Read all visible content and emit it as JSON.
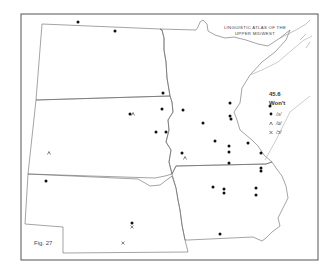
{
  "map": {
    "title_line1": "LINGUISTIC ATLAS OF THE",
    "title_line2": "UPPER MIDWEST",
    "figure_label": "Fig. 27",
    "legend": {
      "item_number": "45.6",
      "heading": "Won't",
      "entries": [
        {
          "symbol": "dot",
          "glyph": "•",
          "label": "/ʌ/"
        },
        {
          "symbol": "caret",
          "glyph": "^",
          "label": "/ɑ/"
        },
        {
          "symbol": "cross",
          "glyph": "X",
          "label": "/ɔ/"
        }
      ]
    },
    "states": [
      "North Dakota",
      "South Dakota",
      "Nebraska",
      "Minnesota",
      "Iowa"
    ],
    "colors": {
      "border": "#666666",
      "frame": "#555555",
      "marker": "#111111"
    },
    "markers": {
      "dots": [
        [
          78,
          22
        ],
        [
          115,
          31
        ],
        [
          163,
          93
        ],
        [
          162,
          109
        ],
        [
          130,
          114
        ],
        [
          156,
          132
        ],
        [
          183,
          110
        ],
        [
          166,
          132
        ],
        [
          203,
          123
        ],
        [
          230,
          103
        ],
        [
          230,
          116
        ],
        [
          231,
          119
        ],
        [
          215,
          141
        ],
        [
          182,
          153
        ],
        [
          229,
          146
        ],
        [
          229,
          152
        ],
        [
          248,
          143
        ],
        [
          261,
          153
        ],
        [
          229,
          163
        ],
        [
          261,
          168
        ],
        [
          261,
          171
        ],
        [
          213,
          187
        ],
        [
          224,
          189
        ],
        [
          224,
          193
        ],
        [
          256,
          188
        ],
        [
          256,
          195
        ],
        [
          220,
          234
        ],
        [
          46,
          181
        ],
        [
          132,
          223
        ],
        [
          270,
          106
        ]
      ],
      "carets": [
        [
          133,
          114
        ],
        [
          49,
          153
        ],
        [
          185,
          158
        ]
      ],
      "crosses": [
        [
          132,
          227
        ],
        [
          123,
          243
        ]
      ]
    }
  }
}
